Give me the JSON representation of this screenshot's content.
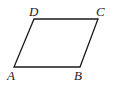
{
  "figure": {
    "type": "parallelogram",
    "stroke_color": "#1a1a1a",
    "background": "#ffffff",
    "vertices": {
      "A": {
        "label": "A",
        "x": 14,
        "y": 67
      },
      "B": {
        "label": "B",
        "x": 80,
        "y": 67
      },
      "C": {
        "label": "C",
        "x": 98,
        "y": 19
      },
      "D": {
        "label": "D",
        "x": 34,
        "y": 19
      }
    }
  }
}
